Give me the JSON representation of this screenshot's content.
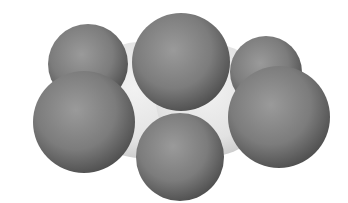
{
  "figure": {
    "kind": "space-filling molecular model",
    "background": "#ffffff",
    "colors": {
      "light_atom": "#e6e6e6",
      "dark_atom": "#7a7a7a"
    },
    "atoms": [
      {
        "id": "light-left",
        "cx": 140,
        "cy": 100,
        "r": 58,
        "shade": "light"
      },
      {
        "id": "light-right",
        "cx": 212,
        "cy": 100,
        "r": 56,
        "shade": "light"
      },
      {
        "id": "dark-back-left",
        "cx": 88,
        "cy": 64,
        "r": 40,
        "shade": "dark"
      },
      {
        "id": "dark-back-right",
        "cx": 266,
        "cy": 72,
        "r": 36,
        "shade": "dark"
      },
      {
        "id": "dark-bottom",
        "cx": 180,
        "cy": 157,
        "r": 44,
        "shade": "dark"
      },
      {
        "id": "dark-front-left",
        "cx": 84,
        "cy": 122,
        "r": 51,
        "shade": "dark"
      },
      {
        "id": "dark-front-right",
        "cx": 279,
        "cy": 117,
        "r": 51,
        "shade": "dark"
      },
      {
        "id": "dark-top",
        "cx": 181,
        "cy": 62,
        "r": 49,
        "shade": "dark"
      }
    ]
  }
}
